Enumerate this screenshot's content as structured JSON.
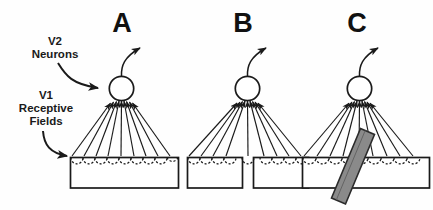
{
  "figure": {
    "background_color": "#fefefe",
    "ink_color": "#1a1a1a"
  },
  "annotations": {
    "v2_label": {
      "line1": "V2",
      "line2": "Neurons",
      "target": "neuron-soma-a"
    },
    "v1_label": {
      "line1": "V1",
      "line2": "Receptive",
      "line3": "Fields",
      "target": "receptive-field-row-a"
    }
  },
  "panels": [
    {
      "letter": "A",
      "condition": "intact",
      "cortex_segments": 1,
      "receptive_field_count": 9,
      "afferent_count": 9,
      "occluder": false,
      "gap": false
    },
    {
      "letter": "B",
      "condition": "lesion-gap",
      "cortex_segments": 2,
      "receptive_field_count": 9,
      "afferent_count": 9,
      "occluder": false,
      "gap": true
    },
    {
      "letter": "C",
      "condition": "occluder-bar",
      "cortex_segments": 1,
      "receptive_field_count": 9,
      "afferent_count": 9,
      "occluder": true,
      "gap": false,
      "occluder_color": "#8a8a8a",
      "occluder_edge_color": "#2b2b2b"
    }
  ]
}
